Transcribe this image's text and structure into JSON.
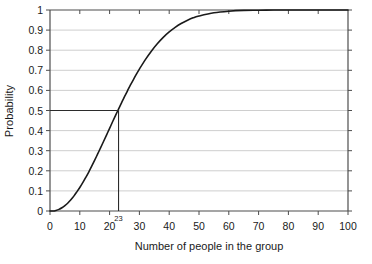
{
  "chart_data": {
    "type": "line",
    "title": "",
    "xlabel": "Number of people in the group",
    "ylabel": "Probability",
    "xlim": [
      0,
      100
    ],
    "ylim": [
      0,
      1
    ],
    "grid": true,
    "legend": false,
    "xticks": [
      "0",
      "10",
      "20",
      "30",
      "40",
      "50",
      "60",
      "70",
      "80",
      "90",
      "100"
    ],
    "xtick_values": [
      0,
      10,
      20,
      30,
      40,
      50,
      60,
      70,
      80,
      90,
      100
    ],
    "yticks": [
      "0",
      "0.1",
      "0.2",
      "0.3",
      "0.4",
      "0.5",
      "0.6",
      "0.7",
      "0.8",
      "0.9",
      "1"
    ],
    "ytick_values": [
      0,
      0.1,
      0.2,
      0.3,
      0.4,
      0.5,
      0.6,
      0.7,
      0.8,
      0.9,
      1
    ],
    "series": [
      {
        "name": "Probability of shared birthday",
        "color": "#1a1a1a",
        "x": [
          0,
          1,
          2,
          3,
          4,
          5,
          6,
          7,
          8,
          9,
          10,
          11,
          12,
          13,
          14,
          15,
          16,
          17,
          18,
          19,
          20,
          21,
          22,
          23,
          24,
          25,
          26,
          27,
          28,
          29,
          30,
          32,
          34,
          36,
          38,
          40,
          42,
          44,
          46,
          48,
          50,
          55,
          60,
          65,
          70,
          75,
          80,
          85,
          90,
          95,
          100
        ],
        "values": [
          0,
          0,
          0.003,
          0.008,
          0.016,
          0.027,
          0.04,
          0.056,
          0.074,
          0.095,
          0.117,
          0.141,
          0.167,
          0.194,
          0.223,
          0.253,
          0.284,
          0.315,
          0.347,
          0.379,
          0.411,
          0.444,
          0.476,
          0.507,
          0.538,
          0.569,
          0.598,
          0.627,
          0.654,
          0.681,
          0.706,
          0.753,
          0.795,
          0.832,
          0.864,
          0.891,
          0.914,
          0.933,
          0.948,
          0.961,
          0.97,
          0.986,
          0.994,
          0.998,
          0.999,
          1,
          1,
          1,
          1,
          1,
          1
        ]
      }
    ],
    "annotations": [
      {
        "name": "threshold-marker",
        "label": "23",
        "x": 23,
        "y": 0.5,
        "description": "Vertical drop line at x = 23 meeting horizontal line at probability 0.5"
      }
    ]
  },
  "axis": {
    "ylabel": "Probability",
    "xlabel": "Number of people in the group"
  }
}
